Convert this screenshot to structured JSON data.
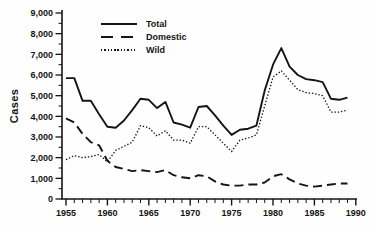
{
  "figure": {
    "background": "#fefefe",
    "ink_color": "#141414"
  },
  "chart_data": {
    "type": "line",
    "title": "",
    "ylabel": "Cases",
    "xlabel": "",
    "xlim": [
      1955,
      1990
    ],
    "ylim": [
      0,
      9000
    ],
    "grid": false,
    "legend_position": "top-left-inside",
    "x": [
      1955,
      1956,
      1957,
      1958,
      1959,
      1960,
      1961,
      1962,
      1963,
      1964,
      1965,
      1966,
      1967,
      1968,
      1969,
      1970,
      1971,
      1972,
      1973,
      1974,
      1975,
      1976,
      1977,
      1978,
      1979,
      1980,
      1981,
      1982,
      1983,
      1984,
      1985,
      1986,
      1987,
      1988,
      1989
    ],
    "series": [
      {
        "name": "Total",
        "style": "solid",
        "color": "#141414",
        "values": [
          5850,
          5850,
          4750,
          4750,
          4100,
          3500,
          3450,
          3800,
          4300,
          4850,
          4800,
          4400,
          4700,
          3700,
          3600,
          3450,
          4450,
          4500,
          4050,
          3550,
          3100,
          3350,
          3400,
          3550,
          5250,
          6500,
          7300,
          6400,
          6000,
          5800,
          5750,
          5650,
          4850,
          4800,
          4900
        ]
      },
      {
        "name": "Domestic",
        "style": "long-dash",
        "color": "#141414",
        "values": [
          3900,
          3700,
          3150,
          2750,
          2600,
          1850,
          1550,
          1450,
          1350,
          1400,
          1350,
          1300,
          1400,
          1150,
          1050,
          1000,
          1150,
          1100,
          850,
          700,
          650,
          650,
          700,
          700,
          800,
          1100,
          1200,
          950,
          750,
          650,
          600,
          650,
          700,
          750,
          750
        ]
      },
      {
        "name": "Wild",
        "style": "dotted",
        "color": "#141414",
        "values": [
          1900,
          2100,
          2000,
          2050,
          2150,
          1800,
          2350,
          2550,
          2750,
          3550,
          3450,
          3050,
          3300,
          2850,
          2850,
          2700,
          3500,
          3500,
          3100,
          2700,
          2300,
          2850,
          2950,
          3100,
          4500,
          5900,
          6200,
          5750,
          5300,
          5150,
          5100,
          5000,
          4200,
          4200,
          4300
        ]
      }
    ],
    "y_axis": {
      "tick_values": [
        0,
        1000,
        2000,
        3000,
        4000,
        5000,
        6000,
        7000,
        8000,
        9000
      ],
      "tick_labels": [
        "0",
        "1,000",
        "2,000",
        "3,000",
        "4,000",
        "5,000",
        "6,000",
        "7,000",
        "8,000",
        "9,000"
      ],
      "minor_tick_step": 500
    },
    "x_axis": {
      "tick_values": [
        1955,
        1960,
        1965,
        1970,
        1975,
        1980,
        1985,
        1990
      ],
      "tick_labels": [
        "1955",
        "1960",
        "1965",
        "1970",
        "1975",
        "1980",
        "1985",
        "1990"
      ],
      "minor_tick_step": 1
    }
  }
}
